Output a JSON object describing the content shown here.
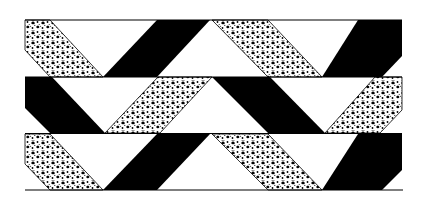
{
  "figure": {
    "colors": {
      "background": "#ffffff",
      "solid": "#000000",
      "stipple": "#000000"
    },
    "bands": [
      {
        "name": "band-top",
        "y_top": 20,
        "y_bottom": 77
      },
      {
        "name": "band-middle",
        "y_top": 77,
        "y_bottom": 133
      },
      {
        "name": "band-bottom",
        "y_top": 133,
        "y_bottom": 190
      }
    ]
  }
}
